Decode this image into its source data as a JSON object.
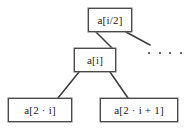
{
  "diagram": {
    "type": "binary-heap-tree-fragment",
    "background_color": "#ffffff",
    "border_color": "#4a4a4a",
    "text_color": "#1a1a1a",
    "nodes": [
      {
        "id": "parent",
        "label": "a[i/2]",
        "role": "parent-node"
      },
      {
        "id": "current",
        "label": "a[i]",
        "role": "current-node"
      },
      {
        "id": "left_child",
        "label": "a[2 · i]",
        "role": "left-child-node"
      },
      {
        "id": "right_child",
        "label": "a[2 · i + 1]",
        "role": "right-child-node"
      }
    ],
    "edges": [
      {
        "from": "parent",
        "to": "current"
      },
      {
        "from": "parent",
        "to": "continuation"
      },
      {
        "from": "current",
        "to": "left_child"
      },
      {
        "from": "current",
        "to": "right_child"
      }
    ],
    "ellipsis": {
      "label": "· · · ·",
      "dot_count": 4,
      "meaning": "continuation-of-tree"
    }
  }
}
